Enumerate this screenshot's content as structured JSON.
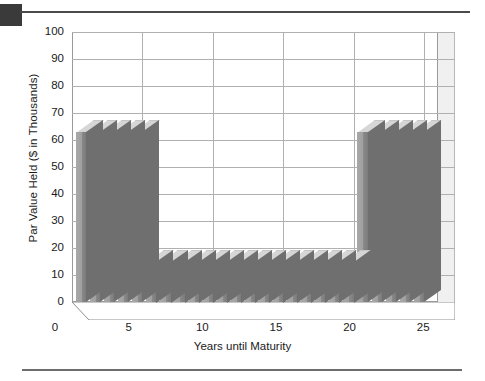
{
  "figure": {
    "corner_mark": "page-marker",
    "rule_top": "horizontal-rule",
    "rule_bottom": "horizontal-rule"
  },
  "chart_data": {
    "type": "bar",
    "title": "",
    "subtitle": "",
    "xlabel": "Years until Maturity",
    "ylabel": "Par Value Held ($ in Thousands)",
    "ylim": [
      0,
      100
    ],
    "yticks": [
      0,
      10,
      20,
      30,
      40,
      50,
      60,
      70,
      80,
      90,
      100
    ],
    "ytick_labels": [
      "0",
      "10",
      "20",
      "30",
      "40",
      "50",
      "60",
      "70",
      "80",
      "90",
      "100"
    ],
    "xlim": [
      0,
      26
    ],
    "xticks": [
      0,
      5,
      10,
      15,
      20,
      25
    ],
    "xtick_labels": [
      "0",
      "5",
      "10",
      "15",
      "20",
      "25"
    ],
    "grid": true,
    "grid_axis": "both",
    "legend": "none",
    "three_d": true,
    "bar_color": "#9c9c9c",
    "bar_top_color": "#d6d6d6",
    "bar_side_color": "#6f6f6f",
    "grid_color": "#b0b0b0",
    "frame_color": "#9a9a9a",
    "categories": [
      1,
      2,
      3,
      4,
      5,
      6,
      7,
      8,
      9,
      10,
      11,
      12,
      13,
      14,
      15,
      16,
      17,
      18,
      19,
      20,
      21,
      22,
      23,
      24,
      25
    ],
    "values": [
      63,
      63,
      63,
      63,
      63,
      15,
      15,
      15,
      15,
      15,
      15,
      15,
      15,
      15,
      15,
      15,
      15,
      15,
      15,
      15,
      63,
      63,
      63,
      63,
      63
    ]
  }
}
